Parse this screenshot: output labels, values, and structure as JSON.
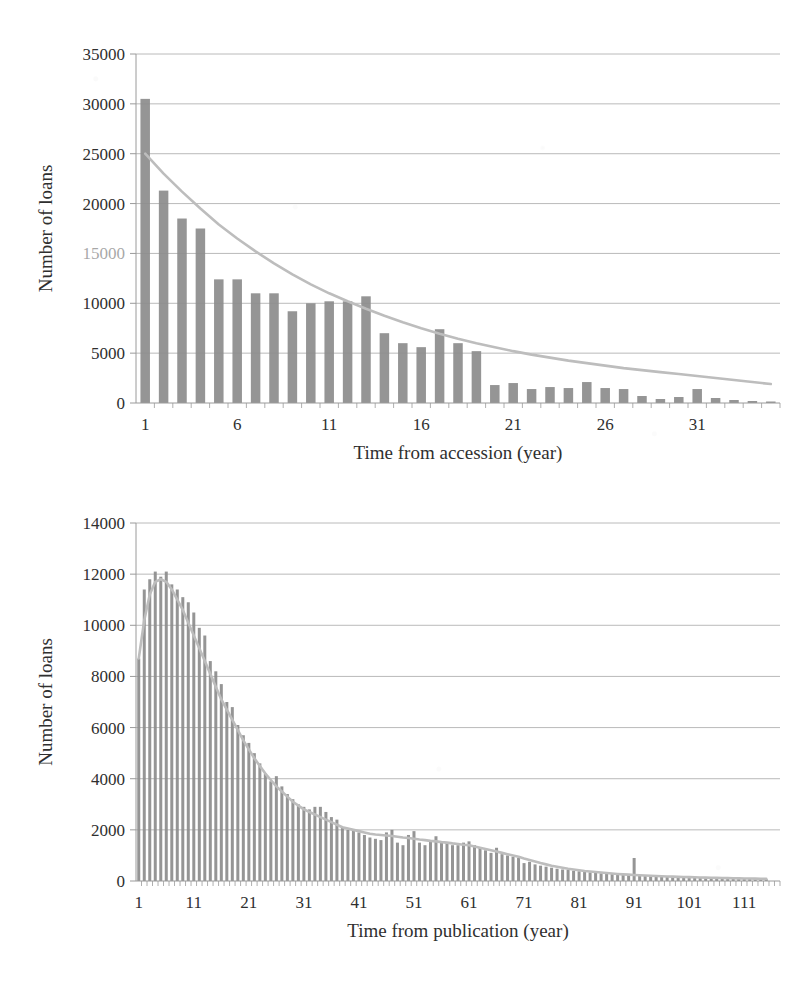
{
  "document": {
    "type": "scanned-figure-page",
    "figure_count": 2,
    "ink_color": "#2f2f2f",
    "bar_color": "#8c8c8c",
    "trend_color": "#bdbdbd",
    "grid_color": "#9a9a9a",
    "background": "#ffffff"
  },
  "chart_data": [
    {
      "id": "chart-accession",
      "type": "bar",
      "title": "",
      "xlabel": "Time from accession (year)",
      "ylabel": "Number of loans",
      "ylim": [
        0,
        35000
      ],
      "ytick_labels": [
        "0",
        "5000",
        "10000",
        "15000",
        "20000",
        "25000",
        "30000",
        "35000"
      ],
      "ytick_values": [
        0,
        5000,
        10000,
        15000,
        20000,
        25000,
        30000,
        35000
      ],
      "ytick_label_faded": "15000",
      "xlim": [
        0.5,
        35.5
      ],
      "xtick_labels": [
        "1",
        "6",
        "11",
        "16",
        "21",
        "26",
        "31"
      ],
      "xtick_values": [
        1,
        6,
        11,
        16,
        21,
        26,
        31
      ],
      "grid": true,
      "grid_axis": "y",
      "legend": "none",
      "has_trendline": true,
      "trendline_type": "smoothed-decay",
      "categories": [
        1,
        2,
        3,
        4,
        5,
        6,
        7,
        8,
        9,
        10,
        11,
        12,
        13,
        14,
        15,
        16,
        17,
        18,
        19,
        20,
        21,
        22,
        23,
        24,
        25,
        26,
        27,
        28,
        29,
        30,
        31,
        32,
        33,
        34,
        35
      ],
      "values": [
        30500,
        21300,
        18500,
        17500,
        12400,
        12400,
        11000,
        11000,
        9200,
        10000,
        10200,
        10200,
        10700,
        7000,
        6000,
        5600,
        7400,
        6000,
        5200,
        1800,
        2000,
        1400,
        1600,
        1500,
        2100,
        1500,
        1400,
        700,
        400,
        600,
        1400,
        500,
        300,
        200,
        150
      ],
      "trend_values": [
        25000,
        23000,
        21200,
        19500,
        17900,
        16500,
        15200,
        14000,
        12900,
        11900,
        11000,
        10200,
        9450,
        8750,
        8100,
        7500,
        6950,
        6450,
        6000,
        5600,
        5200,
        4850,
        4550,
        4250,
        4000,
        3750,
        3500,
        3300,
        3100,
        2900,
        2700,
        2500,
        2300,
        2100,
        1900
      ]
    },
    {
      "id": "chart-publication",
      "type": "bar",
      "title": "",
      "xlabel": "Time from publication (year)",
      "ylabel": "Number of loans",
      "ylim": [
        0,
        14000
      ],
      "ytick_labels": [
        "0",
        "2000",
        "4000",
        "6000",
        "8000",
        "10000",
        "12000",
        "14000"
      ],
      "ytick_values": [
        0,
        2000,
        4000,
        6000,
        8000,
        10000,
        12000,
        14000
      ],
      "xlim": [
        0.5,
        117.5
      ],
      "xtick_labels": [
        "1",
        "11",
        "21",
        "31",
        "41",
        "51",
        "61",
        "71",
        "81",
        "91",
        "101",
        "111"
      ],
      "xtick_values": [
        1,
        11,
        21,
        31,
        41,
        51,
        61,
        71,
        81,
        91,
        101,
        111
      ],
      "grid": true,
      "grid_axis": "y",
      "legend": "none",
      "has_trendline": true,
      "trendline_type": "smoothed-decay",
      "categories": [
        1,
        2,
        3,
        4,
        5,
        6,
        7,
        8,
        9,
        10,
        11,
        12,
        13,
        14,
        15,
        16,
        17,
        18,
        19,
        20,
        21,
        22,
        23,
        24,
        25,
        26,
        27,
        28,
        29,
        30,
        31,
        32,
        33,
        34,
        35,
        36,
        37,
        38,
        39,
        40,
        41,
        42,
        43,
        44,
        45,
        46,
        47,
        48,
        49,
        50,
        51,
        52,
        53,
        54,
        55,
        56,
        57,
        58,
        59,
        60,
        61,
        62,
        63,
        64,
        65,
        66,
        67,
        68,
        69,
        70,
        71,
        72,
        73,
        74,
        75,
        76,
        77,
        78,
        79,
        80,
        81,
        82,
        83,
        84,
        85,
        86,
        87,
        88,
        89,
        90,
        91,
        92,
        93,
        94,
        95,
        96,
        97,
        98,
        99,
        100,
        101,
        102,
        103,
        104,
        105,
        106,
        107,
        108,
        109,
        110,
        111,
        112,
        113,
        114,
        115,
        116,
        117
      ],
      "values": [
        8700,
        11400,
        11800,
        12100,
        11900,
        12100,
        11600,
        11400,
        11100,
        10900,
        10500,
        9900,
        9600,
        8600,
        8200,
        7700,
        7000,
        6800,
        6100,
        5700,
        5400,
        5000,
        4600,
        4200,
        3900,
        4100,
        3700,
        3400,
        3200,
        3000,
        2900,
        2800,
        2900,
        2900,
        2700,
        2500,
        2400,
        2100,
        2000,
        2000,
        1900,
        1800,
        1700,
        1650,
        1600,
        1900,
        2000,
        1500,
        1400,
        1800,
        1950,
        1500,
        1400,
        1600,
        1750,
        1500,
        1500,
        1400,
        1400,
        1500,
        1550,
        1400,
        1300,
        1200,
        1100,
        1300,
        1050,
        1000,
        950,
        900,
        700,
        750,
        650,
        600,
        560,
        520,
        480,
        450,
        430,
        400,
        380,
        360,
        340,
        320,
        300,
        280,
        270,
        260,
        250,
        240,
        900,
        210,
        200,
        190,
        180,
        170,
        160,
        150,
        140,
        135,
        130,
        125,
        120,
        115,
        110,
        105,
        100,
        95,
        90,
        85,
        80,
        78,
        75,
        72,
        70
      ],
      "trend_values": [
        8700,
        10200,
        11200,
        11700,
        11800,
        11700,
        11400,
        11000,
        10600,
        10100,
        9600,
        9100,
        8600,
        8100,
        7600,
        7100,
        6700,
        6300,
        5900,
        5500,
        5150,
        4800,
        4500,
        4200,
        3950,
        3700,
        3500,
        3300,
        3100,
        2950,
        2800,
        2700,
        2600,
        2500,
        2400,
        2300,
        2200,
        2100,
        2050,
        2000,
        1950,
        1900,
        1850,
        1820,
        1800,
        1780,
        1760,
        1730,
        1700,
        1680,
        1650,
        1620,
        1600,
        1570,
        1550,
        1520,
        1500,
        1470,
        1450,
        1420,
        1400,
        1350,
        1300,
        1250,
        1200,
        1150,
        1100,
        1050,
        1000,
        950,
        880,
        820,
        760,
        700,
        650,
        600,
        560,
        520,
        480,
        450,
        420,
        390,
        370,
        350,
        330,
        310,
        290,
        275,
        260,
        250,
        235,
        225,
        215,
        205,
        195,
        185,
        178,
        170,
        163,
        156,
        150,
        144,
        138,
        132,
        127,
        122,
        117,
        112,
        108,
        104,
        100,
        96,
        92,
        88,
        85
      ]
    }
  ]
}
